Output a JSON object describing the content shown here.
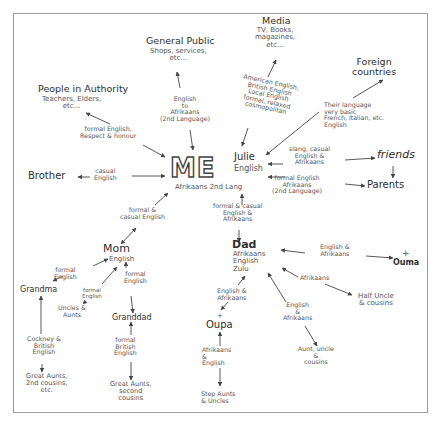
{
  "diagram": {
    "center": {
      "title": "ME",
      "name": "Julie",
      "language_primary": "English",
      "language_secondary": "Afrikaans 2nd Lang"
    },
    "nodes": {
      "media": {
        "title": "Media",
        "sub": "TV, Books,\nmagazines,\netc..."
      },
      "general_public": {
        "title": "General Public",
        "sub": "Shops, services,\netc..."
      },
      "people_authority": {
        "title": "People in Authority",
        "sub": "Teachers, Elders,\netc..."
      },
      "foreign": {
        "title": "Foreign\ncountries"
      },
      "friends": {
        "title": "friends"
      },
      "parents": {
        "title": "Parents"
      },
      "brother": {
        "title": "Brother"
      },
      "mom": {
        "title": "Mom",
        "sub": "English"
      },
      "dad": {
        "title": "Dad",
        "sub": "Afrikaans\nEnglish\nZulu"
      },
      "grandma": {
        "title": "Grandma"
      },
      "granddad": {
        "title": "Granddad"
      },
      "uncles_aunts_mom": {
        "title": "Uncles &\nAunts"
      },
      "great_aunts_grandma": {
        "title": "Great Aunts,\n2nd cousins,\netc."
      },
      "great_aunts_granddad": {
        "title": "Great Aunts,\nsecond\ncousins"
      },
      "oupa": {
        "title": "Oupa",
        "mark": "+"
      },
      "ouma": {
        "title": "Ouma",
        "mark": "+"
      },
      "half_uncle": {
        "title": "Half Uncle\n& cousins"
      },
      "aunt_uncle_cousins": {
        "title": "Aunt, uncle\n&\ncousins"
      },
      "step_aunts": {
        "title": "Step Aunts\n& Uncles"
      }
    },
    "edge_labels": {
      "media": "American English,\nBritish English\nLocal English\nformal, relaxed\ncosmopolitan",
      "general_public": "English\nto\nAfrikaans\n(2nd Language)",
      "authority": "formal English,\nRespect & honour",
      "foreign": "Their language\nvery basic\nFrench, Italian, etc.\nEnglish",
      "friends": "slang, casual\nEnglish &\nAfrikaans",
      "parents": "formal English\nAfrikaans\n(2nd Language)",
      "brother": "casual\nEnglish",
      "mom": "formal &\ncasual English",
      "dad": "formal & casual\nEnglish &\nAfrikaans",
      "mom_grandma": "formal\nEnglish",
      "mom_uncles": "formal\nEnglish",
      "mom_granddad": "formal\nEnglish",
      "grandma_great": "Cockney &\nBritish\nEnglish",
      "granddad_great": "formal\nBritish\nEnglish",
      "dad_ouma": "English &\nAfrikaans",
      "dad_half": "Afrikaans",
      "dad_oupa": "English &\nAfrikaans",
      "dad_aunt": "English\n&\nAfrikaans",
      "oupa_step": "Afrikaans\n&\nEnglish"
    }
  }
}
